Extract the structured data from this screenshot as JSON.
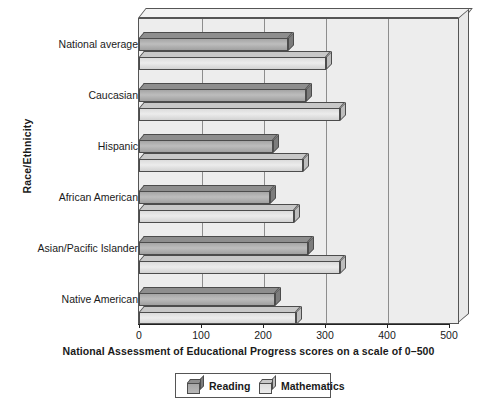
{
  "chart_data": {
    "type": "bar",
    "orientation": "horizontal",
    "title": "",
    "xlabel": "National Assessment of Educational Progress scores on a scale of 0–500",
    "ylabel": "Race/Ethnicity",
    "xlim": [
      0,
      500
    ],
    "xticks": [
      "0",
      "100",
      "200",
      "300",
      "400",
      "500"
    ],
    "xtick_values": [
      0,
      100,
      200,
      300,
      400,
      500
    ],
    "grid": true,
    "legend_position": "bottom",
    "categories": [
      "National average",
      "Caucasian",
      "Hispanic",
      "African American",
      "Asian/Pacific Islander",
      "Native American"
    ],
    "series": [
      {
        "name": "Reading",
        "values": [
          240,
          268,
          215,
          210,
          272,
          218
        ],
        "color": "#b0b0b0"
      },
      {
        "name": "Mathematics",
        "values": [
          300,
          323,
          263,
          250,
          323,
          252
        ],
        "color": "#e0e0e0"
      }
    ]
  },
  "legend": {
    "items": [
      {
        "label": "Reading",
        "icon": "cube-icon"
      },
      {
        "label": "Mathematics",
        "icon": "cube-icon"
      }
    ]
  },
  "icons": {
    "legend_swatch": "cube-icon"
  }
}
